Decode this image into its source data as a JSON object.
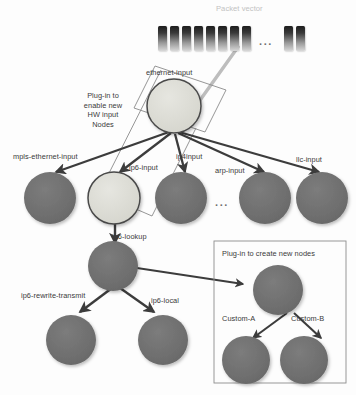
{
  "diagram": {
    "title_text": "Packet vector",
    "packet_vector": {
      "label": "Packet vector",
      "bars_before_ellipsis": 8,
      "bars_after_ellipsis": 2,
      "ellipsis": "..."
    },
    "annotations": {
      "hw_plugin": "Plug-in to\nenable new\nHW input\nNodes",
      "node_plugin_box_title": "Plug-in to create new nodes",
      "row_ellipsis": "...",
      "middle_row_ellipsis": "..."
    },
    "nodes": [
      {
        "id": "ethernet-input",
        "label": "ethernet-input",
        "style": "light"
      },
      {
        "id": "mpls-ethernet-input",
        "label": "mpls-ethernet-input",
        "style": "dark"
      },
      {
        "id": "ip6-input",
        "label": "ip6-input",
        "style": "light"
      },
      {
        "id": "ip4input",
        "label": "ip4input",
        "style": "dark"
      },
      {
        "id": "arp-input",
        "label": "arp-input",
        "style": "dark"
      },
      {
        "id": "llc-input",
        "label": "llc-input",
        "style": "dark"
      },
      {
        "id": "ip6-lookup",
        "label": "ip6-lookup",
        "style": "dark"
      },
      {
        "id": "ip6-rewrite-transmit",
        "label": "ip6-rewrite-transmit",
        "style": "dark"
      },
      {
        "id": "ip6-local",
        "label": "ip6-local",
        "style": "dark"
      },
      {
        "id": "custom-parent",
        "label": "",
        "style": "dark"
      },
      {
        "id": "custom-a",
        "label": "Custom-A",
        "style": "dark"
      },
      {
        "id": "custom-b",
        "label": "Custom-B",
        "style": "dark"
      }
    ],
    "edges": [
      {
        "from": "packet-vector",
        "to": "ethernet-input"
      },
      {
        "from": "ethernet-input",
        "to": "mpls-ethernet-input"
      },
      {
        "from": "ethernet-input",
        "to": "ip6-input"
      },
      {
        "from": "ethernet-input",
        "to": "ip4input"
      },
      {
        "from": "ethernet-input",
        "to": "arp-input"
      },
      {
        "from": "ethernet-input",
        "to": "llc-input"
      },
      {
        "from": "ip6-input",
        "to": "ip6-lookup"
      },
      {
        "from": "ip6-lookup",
        "to": "ip6-rewrite-transmit"
      },
      {
        "from": "ip6-lookup",
        "to": "ip6-local"
      },
      {
        "from": "ip6-lookup",
        "to": "custom-parent"
      },
      {
        "from": "custom-parent",
        "to": "custom-a"
      },
      {
        "from": "custom-parent",
        "to": "custom-b"
      }
    ],
    "colors": {
      "node_dark": "#6e6e6e",
      "node_light": "#dcdcd6",
      "node_stroke": "#4a4a4a",
      "edge": "#3c3c3c",
      "packet_line": "#bdbdbd",
      "callout_stroke": "#8a8a8a",
      "box_stroke": "#8d8d8d",
      "label_text": "#3a3a3a",
      "faint_text": "#c2c2c2",
      "background": "#fdfdfd"
    }
  }
}
